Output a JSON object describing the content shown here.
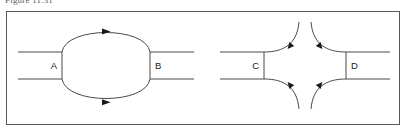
{
  "figure": {
    "caption": "Figure 11.31",
    "frame": {
      "border_color": "#585858",
      "background": "#ffffff"
    },
    "stroke_color": "#4a4a4a",
    "arrowhead_color": "#191919",
    "label_color": "#1d1d1d"
  },
  "diagram": {
    "type": "flow-diagram",
    "groups": [
      {
        "name": "left-group",
        "nodes": [
          {
            "id": "A",
            "label": "A",
            "open_side": "left",
            "label_align": "right"
          },
          {
            "id": "B",
            "label": "B",
            "open_side": "right",
            "label_align": "left"
          }
        ],
        "connectors": [
          {
            "from": "A",
            "to": "B",
            "shape": "arc-convex-up",
            "arrowhead": "right",
            "arrowhead_position": "apex"
          },
          {
            "from": "A",
            "to": "B",
            "shape": "arc-convex-down",
            "arrowhead": "right",
            "arrowhead_position": "apex"
          }
        ]
      },
      {
        "name": "right-group",
        "nodes": [
          {
            "id": "C",
            "label": "C",
            "open_side": "left",
            "label_align": "right"
          },
          {
            "id": "D",
            "label": "D",
            "open_side": "right",
            "label_align": "left"
          }
        ],
        "connectors": [
          {
            "from": "top",
            "to": "C",
            "shape": "concave-curve",
            "arrowhead": "down-left"
          },
          {
            "from": "top",
            "to": "D",
            "shape": "concave-curve",
            "arrowhead": "down-right"
          },
          {
            "from": "bottom",
            "to": "C",
            "shape": "concave-curve",
            "arrowhead": "up-left"
          },
          {
            "from": "bottom",
            "to": "D",
            "shape": "concave-curve",
            "arrowhead": "up-right"
          }
        ]
      }
    ]
  }
}
